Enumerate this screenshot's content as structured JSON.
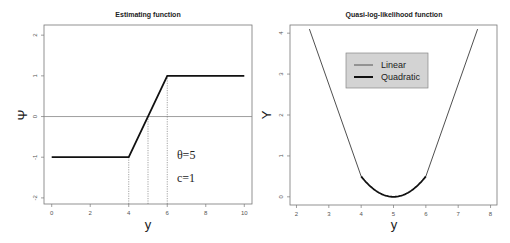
{
  "chart_data": [
    {
      "type": "line",
      "title": "Estimating function",
      "xlabel": "y",
      "ylabel": "Ψ",
      "xlim": [
        -0.4,
        10.4
      ],
      "ylim": [
        -2.15,
        2.25
      ],
      "xticks": [
        0,
        2,
        4,
        6,
        8,
        10
      ],
      "yticks": [
        -2,
        -1,
        0,
        1,
        2
      ],
      "grid": false,
      "series": [
        {
          "name": "psi",
          "x": [
            0,
            4,
            6,
            10
          ],
          "y": [
            -1,
            -1,
            1,
            1
          ],
          "style": "solid-thick"
        }
      ],
      "reference_lines": [
        {
          "type": "hline",
          "y": 0,
          "style": "solid-thin-gray"
        },
        {
          "type": "vline",
          "x": 4,
          "from_y": "bottom",
          "to_y": -1,
          "style": "dotted"
        },
        {
          "type": "vline",
          "x": 5,
          "from_y": "bottom",
          "to_y": 0,
          "style": "dotted"
        },
        {
          "type": "vline",
          "x": 6,
          "from_y": "bottom",
          "to_y": 1,
          "style": "dotted"
        }
      ],
      "annotations": [
        {
          "text": "θ=5",
          "x": 6.5,
          "y": -1.05
        },
        {
          "text": "c=1",
          "x": 6.5,
          "y": -1.6
        }
      ]
    },
    {
      "type": "line",
      "title": "Quasi-log-likelihood function",
      "xlabel": "y",
      "ylabel": "Υ",
      "xlim": [
        1.8,
        8.2
      ],
      "ylim": [
        -0.2,
        4.2
      ],
      "xticks": [
        2,
        3,
        4,
        5,
        6,
        7,
        8
      ],
      "yticks": [
        0,
        1,
        2,
        3,
        4
      ],
      "grid": false,
      "theta": 5,
      "c": 1,
      "series": [
        {
          "name": "Linear",
          "description": "|y-5| - 0.5 for |y-5| > 1",
          "x": [
            2.4,
            4,
            6,
            7.6
          ],
          "y": [
            4.1,
            0.5,
            0.5,
            4.1
          ],
          "style": "thin"
        },
        {
          "name": "Quadratic",
          "description": "(y-5)^2 / 2 for |y-5| <= 1",
          "x": [
            4,
            4.25,
            4.5,
            4.75,
            5,
            5.25,
            5.5,
            5.75,
            6
          ],
          "y": [
            0.5,
            0.281,
            0.125,
            0.031,
            0,
            0.031,
            0.125,
            0.281,
            0.5
          ],
          "style": "thick"
        }
      ],
      "legend": {
        "position": "top-center",
        "entries": [
          "Linear",
          "Quadratic"
        ],
        "background": "#d3d3d3"
      }
    }
  ]
}
